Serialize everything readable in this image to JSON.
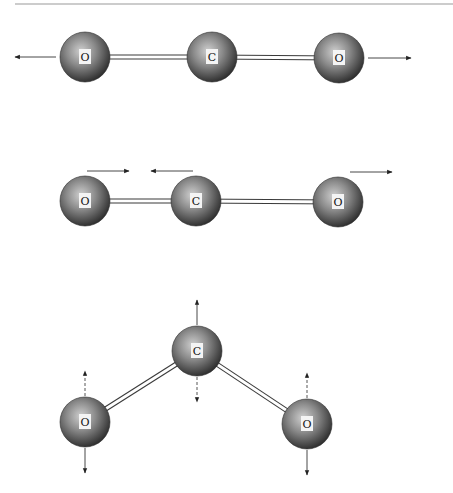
{
  "figure": {
    "colors": {
      "atom_dark": "#2e2e2e",
      "atom_mid": "#7a7a7a",
      "atom_light": "#c8c8c8",
      "bond": "#3a3a3a",
      "arrow": "#333333",
      "rule": "#9a9a9a"
    },
    "modes": [
      {
        "name": "symmetric-stretch",
        "atoms": [
          {
            "label": "O",
            "cx": 85,
            "cy": 57
          },
          {
            "label": "C",
            "cx": 212,
            "cy": 57
          },
          {
            "label": "O",
            "cx": 339,
            "cy": 58
          }
        ],
        "arrows": [
          {
            "x1": 56,
            "y1": 57,
            "x2": 15,
            "y2": 57,
            "style": "solid"
          },
          {
            "x1": 368,
            "y1": 58,
            "x2": 411,
            "y2": 58,
            "style": "solid"
          }
        ]
      },
      {
        "name": "asymmetric-stretch",
        "atoms": [
          {
            "label": "O",
            "cx": 85,
            "cy": 201
          },
          {
            "label": "C",
            "cx": 196,
            "cy": 201
          },
          {
            "label": "O",
            "cx": 338,
            "cy": 202
          }
        ],
        "arrows": [
          {
            "x1": 87,
            "y1": 171,
            "x2": 129,
            "y2": 171,
            "style": "solid"
          },
          {
            "x1": 193,
            "y1": 171,
            "x2": 151,
            "y2": 171,
            "style": "solid"
          },
          {
            "x1": 350,
            "y1": 172,
            "x2": 392,
            "y2": 172,
            "style": "solid"
          }
        ]
      },
      {
        "name": "bending",
        "atoms": [
          {
            "label": "C",
            "cx": 197,
            "cy": 351
          },
          {
            "label": "O",
            "cx": 85,
            "cy": 422
          },
          {
            "label": "O",
            "cx": 307,
            "cy": 424
          }
        ],
        "arrows": [
          {
            "x1": 197,
            "y1": 325,
            "x2": 197,
            "y2": 300,
            "style": "solid"
          },
          {
            "x1": 197,
            "y1": 377,
            "x2": 197,
            "y2": 402,
            "style": "dashed"
          },
          {
            "x1": 85,
            "y1": 396,
            "x2": 85,
            "y2": 371,
            "style": "dashed"
          },
          {
            "x1": 85,
            "y1": 448,
            "x2": 85,
            "y2": 473,
            "style": "solid"
          },
          {
            "x1": 307,
            "y1": 398,
            "x2": 307,
            "y2": 373,
            "style": "dashed"
          },
          {
            "x1": 307,
            "y1": 450,
            "x2": 307,
            "y2": 475,
            "style": "solid"
          }
        ]
      }
    ]
  }
}
